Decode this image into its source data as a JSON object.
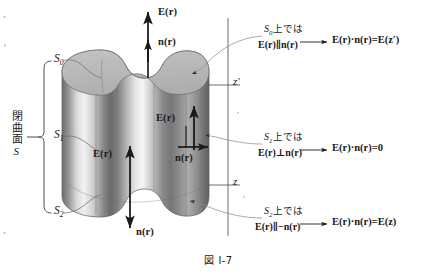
{
  "figure": {
    "caption": "図 I-7",
    "surface_labels": {
      "s0": "S",
      "s0_sub": "0",
      "s1": "S",
      "s1_sub": "1",
      "s2": "S",
      "s2_sub": "2"
    },
    "closed_surface_label": {
      "text": "閉曲面",
      "symbol": "S"
    },
    "axis": {
      "upper_tick_label": "z′",
      "lower_tick_label": "z"
    },
    "vectors": {
      "top_field": "E(r)",
      "top_normal": "n(r)",
      "side_field_right": "E(r)",
      "side_field_mid": "E(r)",
      "side_normal": "n(r)",
      "bottom_normal": "n(r)"
    },
    "annotations": [
      {
        "id": "s0",
        "surface": "S",
        "surface_sub": "0",
        "condition_suffix": "上では",
        "relation": "E(r)∥n(r)",
        "result": "E(r)·n(r)=E(z′)"
      },
      {
        "id": "s1",
        "surface": "S",
        "surface_sub": "1",
        "condition_suffix": "上では",
        "relation": "E(r)⊥n(r)",
        "result": "E(r)·n(r)=0"
      },
      {
        "id": "s2",
        "surface": "S",
        "surface_sub": "2",
        "condition_suffix": "上では",
        "relation": "E(r)∥−n(r)",
        "result": "E(r)·n(r)=E(z)"
      }
    ],
    "colors": {
      "ink": "#1a1a1a",
      "body_light": "#ededed",
      "body_mid": "#9a9a9a",
      "body_dark": "#5c5c5c",
      "top_face": "#b9b9b9",
      "leader": "#8d8d8d",
      "background": "#ffffff"
    }
  }
}
